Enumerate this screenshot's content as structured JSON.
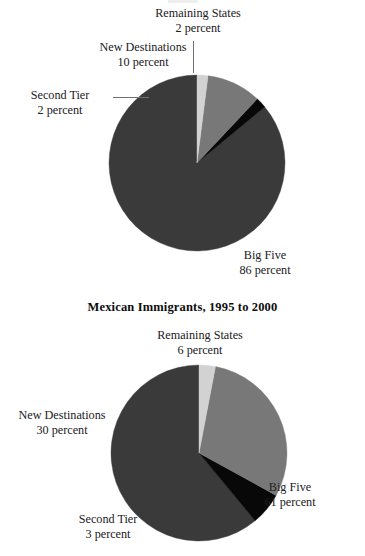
{
  "figure": {
    "width": 365,
    "height": 556,
    "background": "#ffffff"
  },
  "palette": {
    "big_five": "#3a3a3a",
    "remaining_states": "#080808",
    "new_destinations": "#787878",
    "second_tier": "#d2d2d2",
    "leader_line": "#6f6f6f",
    "text": "#20201e",
    "title_text": "#0d0d0d"
  },
  "charts": [
    {
      "id": "top",
      "title": "",
      "center": {
        "x": 197,
        "y": 163
      },
      "radius": 88,
      "labels": {
        "remaining_states": {
          "name": "Remaining States",
          "value": "2 percent"
        },
        "new_destinations": {
          "name": "New Destinations",
          "value": "10 percent"
        },
        "second_tier": {
          "name": "Second Tier",
          "value": "2 percent"
        },
        "big_five": {
          "name": "Big Five",
          "value": "86 percent"
        }
      }
    },
    {
      "id": "bottom",
      "title": "Mexican Immigrants, 1995 to 2000",
      "center": {
        "x": 199,
        "y": 453
      },
      "radius": 88,
      "labels": {
        "remaining_states": {
          "name": "Remaining States",
          "value": "6 percent"
        },
        "new_destinations": {
          "name": "New Destinations",
          "value": "30 percent"
        },
        "second_tier": {
          "name": "Second Tier",
          "value": "3 percent"
        },
        "big_five": {
          "name": "Big Five",
          "value": "61 percent"
        }
      }
    }
  ],
  "chart_data": [
    {
      "type": "pie",
      "id": "top-pie",
      "title": "",
      "subtitle": "",
      "categories": [
        "Big Five",
        "Remaining States",
        "New Destinations",
        "Second Tier"
      ],
      "values": [
        86,
        2,
        10,
        2
      ],
      "unit": "percent",
      "value_labels": [
        "86 percent",
        "2 percent",
        "10 percent",
        "2 percent"
      ],
      "colors": [
        "#3a3a3a",
        "#080808",
        "#787878",
        "#d2d2d2"
      ],
      "start_angle_deg": 90,
      "direction": "counterclockwise",
      "legend": "none",
      "annotations": [
        "Remaining States 2 percent",
        "New Destinations 10 percent",
        "Second Tier 2 percent",
        "Big Five 86 percent"
      ]
    },
    {
      "type": "pie",
      "id": "bottom-pie",
      "title": "Mexican Immigrants, 1995 to 2000",
      "subtitle": "",
      "categories": [
        "Big Five",
        "Remaining States",
        "New Destinations",
        "Second Tier"
      ],
      "values": [
        61,
        6,
        30,
        3
      ],
      "unit": "percent",
      "value_labels": [
        "61 percent",
        "6 percent",
        "30 percent",
        "3 percent"
      ],
      "colors": [
        "#3a3a3a",
        "#080808",
        "#787878",
        "#d2d2d2"
      ],
      "start_angle_deg": 90,
      "direction": "counterclockwise",
      "legend": "none",
      "annotations": [
        "Remaining States 6 percent",
        "New Destinations 30 percent",
        "Second Tier 3 percent",
        "Big Five 61 percent"
      ]
    }
  ]
}
